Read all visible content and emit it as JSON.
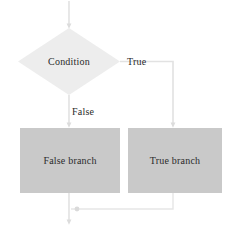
{
  "diagram": {
    "canvas": {
      "width": 238,
      "height": 234,
      "background": "#ffffff"
    },
    "colors": {
      "decision_fill": "#ededed",
      "process_fill": "#c9c9c9",
      "edge_stroke": "#d8d8d8",
      "text": "#2b2b2b"
    },
    "nodes": [
      {
        "id": "condition",
        "shape": "diamond",
        "label": "Condition",
        "fill": "#ededed"
      },
      {
        "id": "false_branch",
        "shape": "rectangle",
        "label": "False branch",
        "fill": "#c9c9c9"
      },
      {
        "id": "true_branch",
        "shape": "rectangle",
        "label": "True branch",
        "fill": "#c9c9c9"
      }
    ],
    "edges": [
      {
        "id": "entry",
        "from": "start",
        "to": "condition",
        "label": ""
      },
      {
        "id": "condition_true",
        "from": "condition",
        "to": "true_branch",
        "label": "True"
      },
      {
        "id": "condition_false",
        "from": "condition",
        "to": "false_branch",
        "label": "False"
      },
      {
        "id": "false_exit",
        "from": "false_branch",
        "to": "merge",
        "label": ""
      },
      {
        "id": "true_exit",
        "from": "true_branch",
        "to": "merge",
        "label": ""
      },
      {
        "id": "merge_exit",
        "from": "merge",
        "to": "end",
        "label": ""
      }
    ]
  }
}
